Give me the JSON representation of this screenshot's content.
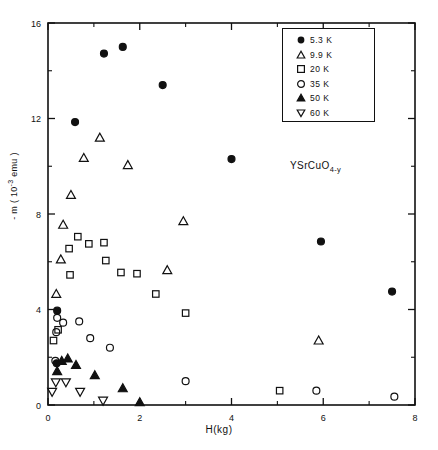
{
  "figure": {
    "sample_label_main": "YSrCuO",
    "sample_label_sub": "4-y",
    "xlabel": "H(kg)",
    "ylabel_prefix": "- m ( 10",
    "ylabel_exp": "-3",
    "ylabel_suffix": " emu )",
    "axis_color": "#111111",
    "background": "#ffffff"
  },
  "legend": {
    "entries": [
      {
        "label": "5.3 K",
        "marker": "filled-circle"
      },
      {
        "label": "9.9 K",
        "marker": "open-triangle-up"
      },
      {
        "label": "20 K",
        "marker": "open-square"
      },
      {
        "label": "35 K",
        "marker": "open-circle"
      },
      {
        "label": "50 K",
        "marker": "filled-triangle-up"
      },
      {
        "label": "60 K",
        "marker": "open-triangle-down"
      }
    ]
  },
  "chart_data": {
    "type": "scatter",
    "title": "",
    "subtitle": "",
    "annotations": [
      "YSrCuO4-y"
    ],
    "xlabel": "H(kg)",
    "ylabel": "- m ( 10^-3 emu )",
    "xlim": [
      0,
      8
    ],
    "ylim": [
      0,
      16
    ],
    "xticks": [
      0,
      2,
      4,
      6,
      8
    ],
    "yticks": [
      0,
      4,
      8,
      12,
      16
    ],
    "xminorticks": [
      1,
      3,
      5,
      7
    ],
    "yminorticks": [
      2,
      6,
      10,
      14
    ],
    "grid": false,
    "legend_position": "upper-right",
    "series": [
      {
        "name": "5.3 K",
        "marker": "filled-circle",
        "points": [
          [
            0.59,
            11.85
          ],
          [
            1.22,
            14.72
          ],
          [
            1.63,
            15.0
          ],
          [
            2.5,
            13.4
          ],
          [
            4.0,
            10.3
          ],
          [
            5.95,
            6.85
          ],
          [
            7.5,
            4.75
          ],
          [
            0.2,
            3.95
          ],
          [
            0.19,
            1.75
          ]
        ]
      },
      {
        "name": "9.9 K",
        "marker": "open-triangle-up",
        "points": [
          [
            1.13,
            11.2
          ],
          [
            0.78,
            10.35
          ],
          [
            1.74,
            10.05
          ],
          [
            0.5,
            8.8
          ],
          [
            0.33,
            7.55
          ],
          [
            0.28,
            6.1
          ],
          [
            0.18,
            4.65
          ],
          [
            2.95,
            7.7
          ],
          [
            2.6,
            5.65
          ],
          [
            5.9,
            2.7
          ]
        ]
      },
      {
        "name": "20 K",
        "marker": "open-square",
        "points": [
          [
            0.65,
            7.05
          ],
          [
            0.89,
            6.75
          ],
          [
            0.46,
            6.55
          ],
          [
            1.22,
            6.8
          ],
          [
            1.26,
            6.05
          ],
          [
            0.48,
            5.45
          ],
          [
            1.59,
            5.55
          ],
          [
            1.94,
            5.5
          ],
          [
            0.22,
            3.15
          ],
          [
            0.12,
            2.7
          ],
          [
            2.35,
            4.65
          ],
          [
            3.0,
            3.85
          ],
          [
            5.05,
            0.6
          ]
        ]
      },
      {
        "name": "35 K",
        "marker": "open-circle",
        "points": [
          [
            0.2,
            3.65
          ],
          [
            0.33,
            3.45
          ],
          [
            0.68,
            3.5
          ],
          [
            0.18,
            3.05
          ],
          [
            0.92,
            2.8
          ],
          [
            1.35,
            2.4
          ],
          [
            0.16,
            1.85
          ],
          [
            3.0,
            1.0
          ],
          [
            5.85,
            0.6
          ],
          [
            7.55,
            0.35
          ]
        ]
      },
      {
        "name": "50 K",
        "marker": "filled-triangle-up",
        "points": [
          [
            0.3,
            1.85
          ],
          [
            0.43,
            1.95
          ],
          [
            0.61,
            1.68
          ],
          [
            0.2,
            1.42
          ],
          [
            1.02,
            1.25
          ],
          [
            1.63,
            0.7
          ],
          [
            2.0,
            0.12
          ]
        ]
      },
      {
        "name": "60 K",
        "marker": "open-triangle-down",
        "points": [
          [
            0.17,
            0.95
          ],
          [
            0.39,
            0.95
          ],
          [
            0.09,
            0.55
          ],
          [
            0.7,
            0.55
          ],
          [
            1.2,
            0.18
          ]
        ]
      }
    ]
  }
}
